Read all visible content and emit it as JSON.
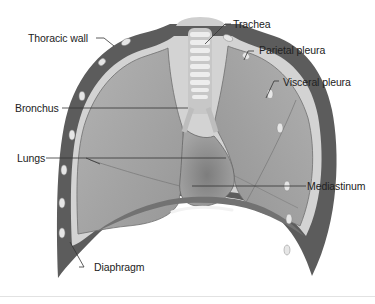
{
  "diagram": {
    "labels": {
      "thoracic_wall": "Thoracic wall",
      "trachea": "Trachea",
      "parietal_pleura": "Parietal pleura",
      "visceral_pleura": "Visceral pleura",
      "bronchus": "Bronchus",
      "lungs": "Lungs",
      "mediastinum": "Mediastinum",
      "diaphragm": "Diaphragm"
    },
    "colors": {
      "background": "#ffffff",
      "lung_fill": "#a9a9a9",
      "lung_shade": "#8e8e8e",
      "wall": "#5a5a5a",
      "pleura_line": "#d8d8d8",
      "rib": "#e4e4e4",
      "leader_line": "#333333",
      "label_text": "#222222"
    }
  }
}
